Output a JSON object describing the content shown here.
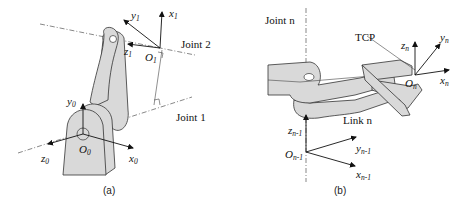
{
  "panel_a": {
    "caption": "(a)",
    "joint_labels": [
      "Joint 2",
      "Joint 1"
    ],
    "frames": [
      {
        "origin": "O",
        "origin_sub": "0",
        "axes": [
          {
            "name": "x",
            "sub": "0"
          },
          {
            "name": "y",
            "sub": "0"
          },
          {
            "name": "z",
            "sub": "0"
          }
        ]
      },
      {
        "origin": "O",
        "origin_sub": "1",
        "axes": [
          {
            "name": "x",
            "sub": "1"
          },
          {
            "name": "y",
            "sub": "1"
          },
          {
            "name": "z",
            "sub": "1"
          }
        ]
      }
    ]
  },
  "panel_b": {
    "caption": "(b)",
    "joint_label": "Joint n",
    "link_label": "Link n",
    "tcp_label": "TCP",
    "frames": [
      {
        "origin": "O",
        "origin_sub": "n",
        "axes": [
          {
            "name": "x",
            "sub": "n"
          },
          {
            "name": "y",
            "sub": "n"
          },
          {
            "name": "z",
            "sub": "n"
          }
        ]
      },
      {
        "origin": "O",
        "origin_sub": "n-1",
        "axes": [
          {
            "name": "x",
            "sub": "n-1"
          },
          {
            "name": "y",
            "sub": "n-1"
          },
          {
            "name": "z",
            "sub": "n-1"
          }
        ]
      }
    ]
  },
  "colors": {
    "part_fill": "#d9d9d9",
    "stroke": "#333333"
  }
}
